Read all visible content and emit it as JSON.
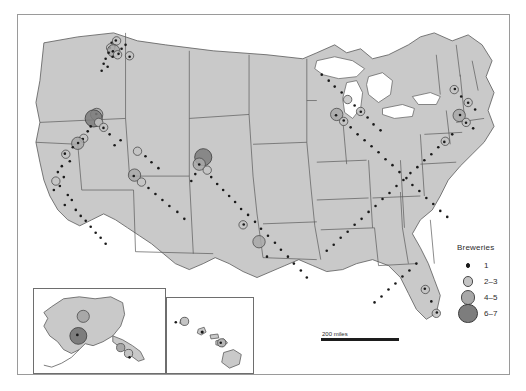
{
  "figure": {
    "kind": "choropleth-point-map",
    "region": "United States",
    "land_color": "#c9c9c9",
    "water_color": "#ffffff",
    "border_color": "#5a5a5a",
    "frame_color": "#9a9a9a"
  },
  "legend": {
    "title": "Breweries",
    "items": [
      {
        "label": "1",
        "radius": 1.3,
        "fill": "#1a1a1a",
        "stroke": "#1a1a1a"
      },
      {
        "label": "2–3",
        "radius": 4.2,
        "fill": "#c4c4c4",
        "stroke": "#4a4a4a"
      },
      {
        "label": "4–5",
        "radius": 6.2,
        "fill": "#a8a8a8",
        "stroke": "#4a4a4a"
      },
      {
        "label": "6–7",
        "radius": 8.6,
        "fill": "#7d7d7d",
        "stroke": "#3a3a3a"
      }
    ]
  },
  "scalebar": {
    "label": "200 miles"
  },
  "insets": [
    {
      "name": "alaska",
      "label": "Alaska"
    },
    {
      "name": "hawaii",
      "label": "Hawaii"
    }
  ],
  "chart_data": {
    "type": "scatter",
    "title": "Breweries",
    "xlabel": "",
    "ylabel": "",
    "legend_position": "right",
    "grid": false,
    "value_classes": [
      "1",
      "2–3",
      "4–5",
      "6–7"
    ],
    "markers": [
      {
        "x": 94,
        "y": 28,
        "c": 1
      },
      {
        "x": 97,
        "y": 31,
        "c": 1
      },
      {
        "x": 93,
        "y": 33,
        "c": 2
      },
      {
        "x": 99,
        "y": 26,
        "c": 2
      },
      {
        "x": 96,
        "y": 36,
        "c": 3
      },
      {
        "x": 91,
        "y": 38,
        "c": 1
      },
      {
        "x": 100,
        "y": 40,
        "c": 2
      },
      {
        "x": 95,
        "y": 42,
        "c": 1
      },
      {
        "x": 88,
        "y": 44,
        "c": 1
      },
      {
        "x": 104,
        "y": 34,
        "c": 1
      },
      {
        "x": 108,
        "y": 30,
        "c": 1
      },
      {
        "x": 112,
        "y": 41,
        "c": 2
      },
      {
        "x": 86,
        "y": 49,
        "c": 1
      },
      {
        "x": 90,
        "y": 52,
        "c": 1
      },
      {
        "x": 84,
        "y": 56,
        "c": 1
      },
      {
        "x": 79,
        "y": 100,
        "c": 3
      },
      {
        "x": 76,
        "y": 104,
        "c": 4
      },
      {
        "x": 81,
        "y": 108,
        "c": 2
      },
      {
        "x": 73,
        "y": 112,
        "c": 1
      },
      {
        "x": 86,
        "y": 113,
        "c": 2
      },
      {
        "x": 70,
        "y": 117,
        "c": 1
      },
      {
        "x": 92,
        "y": 120,
        "c": 1
      },
      {
        "x": 66,
        "y": 124,
        "c": 2
      },
      {
        "x": 60,
        "y": 129,
        "c": 3
      },
      {
        "x": 55,
        "y": 133,
        "c": 1
      },
      {
        "x": 97,
        "y": 131,
        "c": 1
      },
      {
        "x": 103,
        "y": 126,
        "c": 1
      },
      {
        "x": 48,
        "y": 140,
        "c": 2
      },
      {
        "x": 52,
        "y": 147,
        "c": 1
      },
      {
        "x": 44,
        "y": 152,
        "c": 1
      },
      {
        "x": 40,
        "y": 158,
        "c": 1
      },
      {
        "x": 46,
        "y": 163,
        "c": 1
      },
      {
        "x": 38,
        "y": 167,
        "c": 2
      },
      {
        "x": 42,
        "y": 172,
        "c": 1
      },
      {
        "x": 36,
        "y": 176,
        "c": 1
      },
      {
        "x": 50,
        "y": 181,
        "c": 1
      },
      {
        "x": 54,
        "y": 186,
        "c": 1
      },
      {
        "x": 47,
        "y": 191,
        "c": 1
      },
      {
        "x": 58,
        "y": 196,
        "c": 1
      },
      {
        "x": 63,
        "y": 202,
        "c": 1
      },
      {
        "x": 68,
        "y": 207,
        "c": 1
      },
      {
        "x": 73,
        "y": 213,
        "c": 1
      },
      {
        "x": 78,
        "y": 219,
        "c": 1
      },
      {
        "x": 83,
        "y": 224,
        "c": 1
      },
      {
        "x": 88,
        "y": 230,
        "c": 1
      },
      {
        "x": 120,
        "y": 137,
        "c": 2
      },
      {
        "x": 128,
        "y": 142,
        "c": 1
      },
      {
        "x": 134,
        "y": 148,
        "c": 1
      },
      {
        "x": 141,
        "y": 154,
        "c": 1
      },
      {
        "x": 117,
        "y": 161,
        "c": 3
      },
      {
        "x": 124,
        "y": 168,
        "c": 2
      },
      {
        "x": 131,
        "y": 174,
        "c": 1
      },
      {
        "x": 138,
        "y": 180,
        "c": 1
      },
      {
        "x": 145,
        "y": 186,
        "c": 1
      },
      {
        "x": 152,
        "y": 192,
        "c": 1
      },
      {
        "x": 160,
        "y": 198,
        "c": 1
      },
      {
        "x": 167,
        "y": 205,
        "c": 1
      },
      {
        "x": 186,
        "y": 143,
        "c": 4
      },
      {
        "x": 182,
        "y": 150,
        "c": 3
      },
      {
        "x": 190,
        "y": 156,
        "c": 2
      },
      {
        "x": 178,
        "y": 160,
        "c": 1
      },
      {
        "x": 194,
        "y": 163,
        "c": 1
      },
      {
        "x": 174,
        "y": 167,
        "c": 1
      },
      {
        "x": 200,
        "y": 170,
        "c": 1
      },
      {
        "x": 206,
        "y": 176,
        "c": 1
      },
      {
        "x": 212,
        "y": 182,
        "c": 1
      },
      {
        "x": 218,
        "y": 188,
        "c": 1
      },
      {
        "x": 224,
        "y": 195,
        "c": 1
      },
      {
        "x": 231,
        "y": 201,
        "c": 1
      },
      {
        "x": 238,
        "y": 208,
        "c": 1
      },
      {
        "x": 244,
        "y": 215,
        "c": 1
      },
      {
        "x": 251,
        "y": 222,
        "c": 1
      },
      {
        "x": 258,
        "y": 229,
        "c": 1
      },
      {
        "x": 264,
        "y": 236,
        "c": 1
      },
      {
        "x": 271,
        "y": 243,
        "c": 1
      },
      {
        "x": 277,
        "y": 250,
        "c": 1
      },
      {
        "x": 284,
        "y": 257,
        "c": 1
      },
      {
        "x": 290,
        "y": 264,
        "c": 1
      },
      {
        "x": 226,
        "y": 211,
        "c": 2
      },
      {
        "x": 242,
        "y": 228,
        "c": 3
      },
      {
        "x": 250,
        "y": 243,
        "c": 1
      },
      {
        "x": 305,
        "y": 60,
        "c": 1
      },
      {
        "x": 312,
        "y": 66,
        "c": 1
      },
      {
        "x": 318,
        "y": 72,
        "c": 1
      },
      {
        "x": 325,
        "y": 78,
        "c": 1
      },
      {
        "x": 331,
        "y": 85,
        "c": 2
      },
      {
        "x": 338,
        "y": 91,
        "c": 1
      },
      {
        "x": 344,
        "y": 97,
        "c": 2
      },
      {
        "x": 351,
        "y": 103,
        "c": 1
      },
      {
        "x": 357,
        "y": 110,
        "c": 1
      },
      {
        "x": 364,
        "y": 116,
        "c": 1
      },
      {
        "x": 320,
        "y": 100,
        "c": 3
      },
      {
        "x": 327,
        "y": 107,
        "c": 2
      },
      {
        "x": 334,
        "y": 113,
        "c": 1
      },
      {
        "x": 341,
        "y": 120,
        "c": 1
      },
      {
        "x": 348,
        "y": 126,
        "c": 1
      },
      {
        "x": 355,
        "y": 132,
        "c": 1
      },
      {
        "x": 362,
        "y": 138,
        "c": 1
      },
      {
        "x": 369,
        "y": 145,
        "c": 1
      },
      {
        "x": 376,
        "y": 151,
        "c": 1
      },
      {
        "x": 383,
        "y": 158,
        "c": 1
      },
      {
        "x": 390,
        "y": 164,
        "c": 1
      },
      {
        "x": 396,
        "y": 171,
        "c": 1
      },
      {
        "x": 403,
        "y": 177,
        "c": 1
      },
      {
        "x": 410,
        "y": 184,
        "c": 1
      },
      {
        "x": 417,
        "y": 190,
        "c": 1
      },
      {
        "x": 424,
        "y": 197,
        "c": 1
      },
      {
        "x": 431,
        "y": 203,
        "c": 1
      },
      {
        "x": 438,
        "y": 75,
        "c": 2
      },
      {
        "x": 445,
        "y": 82,
        "c": 1
      },
      {
        "x": 452,
        "y": 88,
        "c": 2
      },
      {
        "x": 459,
        "y": 95,
        "c": 1
      },
      {
        "x": 443,
        "y": 101,
        "c": 3
      },
      {
        "x": 450,
        "y": 108,
        "c": 2
      },
      {
        "x": 457,
        "y": 114,
        "c": 1
      },
      {
        "x": 436,
        "y": 120,
        "c": 1
      },
      {
        "x": 429,
        "y": 127,
        "c": 2
      },
      {
        "x": 422,
        "y": 133,
        "c": 1
      },
      {
        "x": 415,
        "y": 140,
        "c": 1
      },
      {
        "x": 408,
        "y": 146,
        "c": 1
      },
      {
        "x": 401,
        "y": 153,
        "c": 1
      },
      {
        "x": 394,
        "y": 159,
        "c": 1
      },
      {
        "x": 387,
        "y": 166,
        "c": 1
      },
      {
        "x": 380,
        "y": 172,
        "c": 1
      },
      {
        "x": 373,
        "y": 179,
        "c": 1
      },
      {
        "x": 366,
        "y": 185,
        "c": 1
      },
      {
        "x": 359,
        "y": 192,
        "c": 1
      },
      {
        "x": 352,
        "y": 198,
        "c": 1
      },
      {
        "x": 345,
        "y": 205,
        "c": 1
      },
      {
        "x": 338,
        "y": 211,
        "c": 1
      },
      {
        "x": 331,
        "y": 218,
        "c": 1
      },
      {
        "x": 324,
        "y": 224,
        "c": 1
      },
      {
        "x": 317,
        "y": 231,
        "c": 1
      },
      {
        "x": 310,
        "y": 237,
        "c": 1
      },
      {
        "x": 400,
        "y": 250,
        "c": 1
      },
      {
        "x": 393,
        "y": 257,
        "c": 1
      },
      {
        "x": 386,
        "y": 263,
        "c": 1
      },
      {
        "x": 379,
        "y": 270,
        "c": 1
      },
      {
        "x": 372,
        "y": 276,
        "c": 1
      },
      {
        "x": 365,
        "y": 283,
        "c": 1
      },
      {
        "x": 358,
        "y": 289,
        "c": 1
      },
      {
        "x": 409,
        "y": 276,
        "c": 2
      },
      {
        "x": 415,
        "y": 288,
        "c": 1
      },
      {
        "x": 420,
        "y": 300,
        "c": 2
      }
    ]
  }
}
